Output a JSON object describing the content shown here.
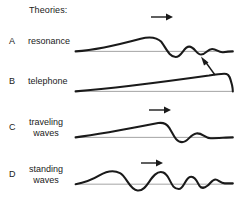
{
  "figure": {
    "title": "Theories:",
    "width": 237,
    "height": 204,
    "background": "#ffffff",
    "ink_color": "#1a1a1a",
    "baseline_color": "#8c8c8c"
  },
  "rows": [
    {
      "letter": "A",
      "label": "resonance",
      "label_lines": 1,
      "arrow": {
        "name": "arrow-right",
        "direction": "right",
        "x": 150,
        "y": 18,
        "length": 22
      },
      "curve": {
        "name": "resonance-curve",
        "description": "envelope rises gently to a broad peak then damped oscillation decaying to the right",
        "path": "M 2 26 C 30 24 58 17 84 10 C 96 7 104 8 110 14 C 116 22 120 33 128 33 C 136 33 138 20 145 20 C 152 20 154 30 160 30 C 166 30 168 23 174 23 C 180 23 182 28 188 27 C 194 26 198 26 200 26"
      }
    },
    {
      "letter": "B",
      "label": "telephone",
      "label_lines": 1,
      "arrow": {
        "name": "arrow-diagonal-up-left",
        "direction": "up-left",
        "x": 200,
        "y": 57,
        "length": 18
      },
      "curve": {
        "name": "telephone-curve",
        "description": "long straight wedge rising to the right ending in a sharp drop at the far right",
        "path": "M 2 26 C 40 23 120 13 170 6 C 182 4 188 3 192 4 C 196 5 197 10 199 18 C 200 23 200 25 200 26"
      }
    },
    {
      "letter": "C",
      "label": "traveling\nwaves",
      "label_lines": 2,
      "arrow": {
        "name": "arrow-right",
        "direction": "right",
        "x": 148,
        "y": 110,
        "length": 22
      },
      "curve": {
        "name": "traveling-waves-curve",
        "description": "wedge rising to a peak around two thirds then a dip and one decaying bump",
        "path": "M 2 26 C 26 23 70 15 106 8 C 112 7 116 8 120 14 C 125 22 128 32 136 32 C 144 32 146 22 154 21 C 162 20 164 27 172 27 C 182 27 192 26 200 26"
      }
    },
    {
      "letter": "D",
      "label": "standing\nwaves",
      "label_lines": 2,
      "arrow": {
        "name": "arrow-right",
        "direction": "right",
        "x": 140,
        "y": 163,
        "length": 22
      },
      "curve": {
        "name": "standing-waves-curve",
        "description": "continuous standing wave with several peaks and troughs of shrinking wavelength",
        "path": "M 2 27 C 14 25 22 22 32 16 C 42 10 50 9 58 13 C 66 17 70 34 80 35 C 90 36 94 22 102 15 C 110 8 116 13 120 21 C 124 29 126 33 132 33 C 138 33 140 20 146 18 C 152 16 155 24 158 29 C 161 33 164 32 168 29 C 172 26 174 21 178 21 C 182 21 184 26 190 26 C 195 26 198 26 200 26"
      }
    }
  ]
}
